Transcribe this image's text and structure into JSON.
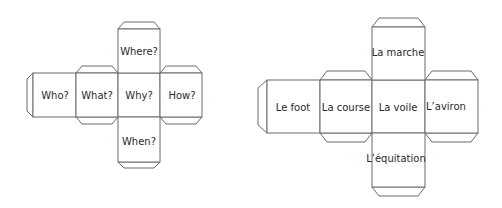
{
  "nets": [
    {
      "name": "question-words-cube",
      "faces": {
        "top": "Where?",
        "far_left": "Who?",
        "left": "What?",
        "center": "Why?",
        "right": "How?",
        "bottom": "When?"
      }
    },
    {
      "name": "french-sports-cube",
      "faces": {
        "top": "La marche",
        "far_left": "Le foot",
        "left": "La course",
        "center": "La voile",
        "right": "L’aviron",
        "bottom": "L’équitation"
      }
    }
  ],
  "colors": {
    "line": "#6a6a6a",
    "text": "#2a2a2a",
    "background": "#ffffff"
  }
}
